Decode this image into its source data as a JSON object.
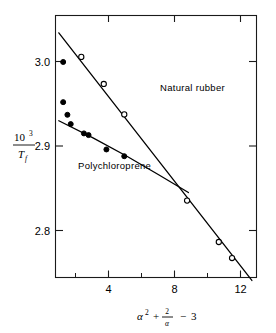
{
  "figure": {
    "background_color": "#ffffff",
    "ink_color": "#000000"
  },
  "chart_data": {
    "type": "scatter",
    "title": "",
    "subtitle": "",
    "xlabel": "α² + 2/α − 3",
    "ylabel": "10³ / T_f",
    "xlabel_parts": {
      "alpha": "α",
      "exponent": "2",
      "plus": "+",
      "numerator": "2",
      "denominator": "α",
      "minus": "−",
      "constant": "3"
    },
    "ylabel_parts": {
      "numerator": "10",
      "numerator_exponent": "3",
      "denominator": "T",
      "denominator_subscript": "f"
    },
    "xlim": [
      -0.6,
      14.6
    ],
    "ylim": [
      2.745,
      3.055
    ],
    "grid": false,
    "legend_position": "inline-annotation",
    "xticks": [
      4,
      8,
      12
    ],
    "xtick_labels": [
      "4",
      "8",
      "12"
    ],
    "xticks_minor": [
      2,
      6,
      10,
      14
    ],
    "yticks": [
      2.8,
      2.9,
      3.0
    ],
    "ytick_labels": [
      "2.8",
      "2.9",
      "3.0"
    ],
    "series": [
      {
        "name": "Natural rubber",
        "label": "Natural rubber",
        "marker": "open-circle",
        "label_x": 7.3,
        "label_y": 2.966,
        "points": [
          {
            "x": 1.35,
            "y": 3.006
          },
          {
            "x": 3.05,
            "y": 2.974
          },
          {
            "x": 4.6,
            "y": 2.938
          },
          {
            "x": 9.35,
            "y": 2.836
          },
          {
            "x": 11.75,
            "y": 2.787
          },
          {
            "x": 12.75,
            "y": 2.768
          }
        ],
        "fit_line": [
          {
            "x": -0.35,
            "y": 3.0345
          },
          {
            "x": 14.25,
            "y": 2.7415
          }
        ]
      },
      {
        "name": "Polychloroprene",
        "label": "Polychloroprene",
        "marker": "filled-circle",
        "label_x": 1.1,
        "label_y": 2.873,
        "points": [
          {
            "x": -0.02,
            "y": 3.0
          },
          {
            "x": -0.02,
            "y": 2.9525
          },
          {
            "x": 0.3,
            "y": 2.9375
          },
          {
            "x": 0.55,
            "y": 2.9265
          },
          {
            "x": 1.55,
            "y": 2.9155
          },
          {
            "x": 1.9,
            "y": 2.9135
          },
          {
            "x": 3.25,
            "y": 2.8965
          },
          {
            "x": 4.6,
            "y": 2.8885
          }
        ],
        "fit_line": [
          {
            "x": -0.35,
            "y": 2.9305
          },
          {
            "x": 2.2,
            "y": 2.9105
          },
          {
            "x": 4.8,
            "y": 2.8885
          },
          {
            "x": 7.2,
            "y": 2.8665
          },
          {
            "x": 9.45,
            "y": 2.8455
          }
        ]
      }
    ],
    "annotations": [
      {
        "text": "Natural rubber",
        "x": 7.3,
        "y": 2.966
      },
      {
        "text": "Polychloroprene",
        "x": 1.1,
        "y": 2.873
      }
    ]
  }
}
